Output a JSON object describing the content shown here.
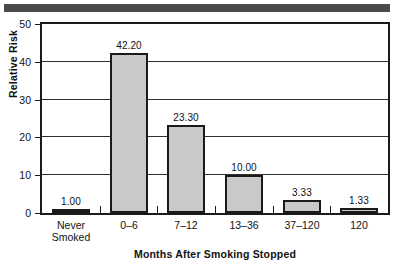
{
  "chart_data": {
    "type": "bar",
    "title": "",
    "xlabel": "Months After Smoking Stopped",
    "ylabel": "Relative Risk",
    "categories": [
      "Never\nSmoked",
      "0–6",
      "7–12",
      "13–36",
      "37–120",
      "120"
    ],
    "values": [
      1.0,
      42.2,
      23.3,
      10.0,
      3.33,
      1.33
    ],
    "data_labels": [
      "1.00",
      "42.20",
      "23.30",
      "10.00",
      "3.33",
      "1.33"
    ],
    "ylim": [
      0,
      50
    ],
    "yticks": [
      0,
      10,
      20,
      30,
      40,
      50
    ],
    "ytick_labels": [
      "0",
      "10",
      "20",
      "30",
      "40",
      "50"
    ],
    "grid": "horizontal",
    "legend": "none",
    "bar_fill": "#c9c9c9",
    "bar_edge": "#1a1a1a",
    "frame_color": "#1a1a1a",
    "band_color": "#4a4a4a"
  }
}
